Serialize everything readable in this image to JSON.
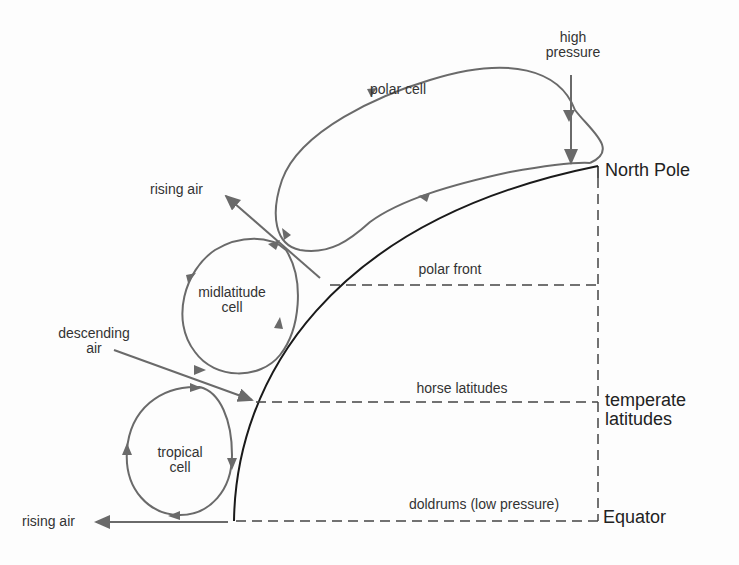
{
  "diagram": {
    "title": "",
    "cells": [
      {
        "id": "polar",
        "label": "polar cell"
      },
      {
        "id": "midlatitude",
        "label": "midlatitude cell"
      },
      {
        "id": "tropical",
        "label": "tropical cell"
      }
    ],
    "labels": {
      "high_pressure": "high pressure",
      "rising_air_top": "rising air",
      "rising_air_bottom": "rising air",
      "descending_air": "descending air",
      "polar_front": "polar front",
      "horse_latitudes": "horse latitudes",
      "doldrums": "doldrums (low pressure)",
      "north_pole": "North Pole",
      "temperate_latitudes": "temperate latitudes",
      "equator": "Equator"
    },
    "text": {
      "polar_cell": "polar cell",
      "mid_line1": "midlatitude",
      "mid_line2": "cell",
      "trop_line1": "tropical",
      "trop_line2": "cell",
      "high_line1": "high",
      "high_line2": "pressure",
      "desc_line1": "descending",
      "desc_line2": "air",
      "temp_line1": "temperate",
      "temp_line2": "latitudes"
    },
    "colors": {
      "arrow": "#6a6a6a",
      "earth": "#1a1a1a",
      "dashed": "#444444",
      "text": "#333333"
    }
  }
}
